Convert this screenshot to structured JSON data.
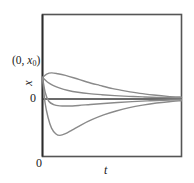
{
  "figure": {
    "labels": {
      "initial_point_prefix": "(0, ",
      "initial_point_var": "x",
      "initial_point_sub": "0",
      "initial_point_suffix": ")",
      "y_axis": "x",
      "zero_y": "0",
      "zero_origin": "0",
      "x_axis": "t"
    },
    "colors": {
      "frame": "#555555",
      "curve": "#8a8a8a",
      "zero_line": "#3a3a3a",
      "axis": "#2b2b2b",
      "background": "#ffffff",
      "text": "#1b1b1b"
    }
  },
  "chart_data": {
    "type": "line",
    "title": "",
    "xlabel": "t",
    "ylabel": "x",
    "xlim": [
      0,
      1
    ],
    "ylim": [
      -1,
      1
    ],
    "grid": false,
    "legend": null,
    "annotations": [
      {
        "text": "(0, x0)",
        "x": 0,
        "y": 0.26
      },
      {
        "text": "0",
        "x": -0.04,
        "y": 0
      },
      {
        "text": "0",
        "x": 0,
        "y": -1.1
      }
    ],
    "note": "Five solution curves all starting at the initial condition (0, x0) and decaying asymptotically to x = 0; two overshoot above, two undershoot below, one decays monotonically.",
    "series": [
      {
        "name": "overshoot-large",
        "comment": "rises to a tall maximum then decays to zero",
        "points": [
          [
            0.0,
            0.26
          ],
          [
            0.02,
            0.52
          ],
          [
            0.045,
            0.7
          ],
          [
            0.07,
            0.79
          ],
          [
            0.105,
            0.835
          ],
          [
            0.135,
            0.82
          ],
          [
            0.175,
            0.76
          ],
          [
            0.225,
            0.665
          ],
          [
            0.29,
            0.545
          ],
          [
            0.365,
            0.43
          ],
          [
            0.445,
            0.33
          ],
          [
            0.53,
            0.245
          ],
          [
            0.62,
            0.175
          ],
          [
            0.71,
            0.12
          ],
          [
            0.8,
            0.08
          ],
          [
            0.89,
            0.05
          ],
          [
            1.0,
            0.028
          ]
        ]
      },
      {
        "name": "overshoot-small",
        "comment": "slight rise then decay",
        "points": [
          [
            0.0,
            0.26
          ],
          [
            0.03,
            0.3
          ],
          [
            0.065,
            0.315
          ],
          [
            0.11,
            0.305
          ],
          [
            0.165,
            0.285
          ],
          [
            0.235,
            0.25
          ],
          [
            0.32,
            0.205
          ],
          [
            0.41,
            0.165
          ],
          [
            0.505,
            0.125
          ],
          [
            0.6,
            0.095
          ],
          [
            0.7,
            0.068
          ],
          [
            0.8,
            0.048
          ],
          [
            0.9,
            0.032
          ],
          [
            1.0,
            0.022
          ]
        ]
      },
      {
        "name": "monotonic-decay",
        "comment": "pure exponential-like decay from x0 to zero",
        "points": [
          [
            0.0,
            0.26
          ],
          [
            0.035,
            0.205
          ],
          [
            0.075,
            0.165
          ],
          [
            0.125,
            0.13
          ],
          [
            0.185,
            0.103
          ],
          [
            0.255,
            0.082
          ],
          [
            0.335,
            0.065
          ],
          [
            0.425,
            0.052
          ],
          [
            0.52,
            0.041
          ],
          [
            0.62,
            0.032
          ],
          [
            0.72,
            0.025
          ],
          [
            0.83,
            0.019
          ],
          [
            1.0,
            0.013
          ]
        ]
      },
      {
        "name": "undershoot-small",
        "comment": "dips slightly below zero then returns",
        "points": [
          [
            0.0,
            0.26
          ],
          [
            0.02,
            0.075
          ],
          [
            0.045,
            -0.04
          ],
          [
            0.08,
            -0.1
          ],
          [
            0.125,
            -0.122
          ],
          [
            0.185,
            -0.125
          ],
          [
            0.26,
            -0.115
          ],
          [
            0.345,
            -0.098
          ],
          [
            0.44,
            -0.08
          ],
          [
            0.54,
            -0.062
          ],
          [
            0.645,
            -0.046
          ],
          [
            0.755,
            -0.033
          ],
          [
            0.87,
            -0.022
          ],
          [
            1.0,
            -0.013
          ]
        ]
      },
      {
        "name": "undershoot-large",
        "comment": "dips to a deep minimum then decays back to zero",
        "points": [
          [
            0.0,
            0.26
          ],
          [
            0.018,
            -0.06
          ],
          [
            0.04,
            -0.33
          ],
          [
            0.065,
            -0.52
          ],
          [
            0.095,
            -0.62
          ],
          [
            0.125,
            -0.65
          ],
          [
            0.165,
            -0.62
          ],
          [
            0.215,
            -0.55
          ],
          [
            0.28,
            -0.46
          ],
          [
            0.355,
            -0.37
          ],
          [
            0.44,
            -0.285
          ],
          [
            0.53,
            -0.215
          ],
          [
            0.625,
            -0.155
          ],
          [
            0.72,
            -0.11
          ],
          [
            0.82,
            -0.072
          ],
          [
            0.91,
            -0.048
          ],
          [
            1.0,
            -0.03
          ]
        ]
      }
    ]
  }
}
